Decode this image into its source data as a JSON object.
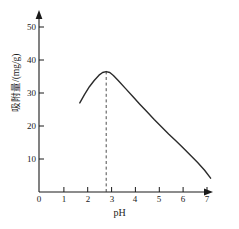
{
  "chart_data": {
    "type": "line",
    "title": "",
    "xlabel": "pH",
    "ylabel": "吸附量/(mg/g)",
    "xlim": [
      0,
      7.6
    ],
    "ylim": [
      0,
      53
    ],
    "grid": false,
    "legend": "none",
    "x_ticks": [
      "0",
      "1",
      "2",
      "3",
      "4",
      "5",
      "6",
      "7"
    ],
    "x_tick_values": [
      0,
      1,
      2,
      3,
      4,
      5,
      6,
      7
    ],
    "y_ticks": [
      "10",
      "20",
      "30",
      "40",
      "50"
    ],
    "y_tick_values": [
      10,
      20,
      30,
      40,
      50
    ],
    "series": [
      {
        "name": "吸附量",
        "x": [
          1.7,
          1.9,
          2.1,
          2.3,
          2.5,
          2.65,
          2.8,
          2.95,
          3.1,
          3.3,
          3.6,
          3.9,
          4.2,
          4.5,
          4.8,
          5.1,
          5.4,
          5.7,
          6.0,
          6.3,
          6.6,
          6.9,
          7.15
        ],
        "y": [
          27.0,
          29.6,
          31.9,
          33.8,
          35.4,
          36.2,
          36.5,
          36.2,
          35.3,
          33.8,
          31.4,
          29.0,
          26.6,
          24.3,
          22.0,
          19.8,
          17.6,
          15.5,
          13.4,
          11.2,
          9.0,
          6.6,
          4.2
        ]
      }
    ],
    "annotations": [
      {
        "name": "peak-marker",
        "type": "vertical-dashed-line",
        "x": 2.8,
        "y_from": 0,
        "y_to": 36.5,
        "label": ""
      }
    ],
    "peak": {
      "x": 2.8,
      "y": 36.5
    }
  },
  "axes": {
    "x_arrow": true,
    "y_arrow": true,
    "origin_label": "0"
  }
}
